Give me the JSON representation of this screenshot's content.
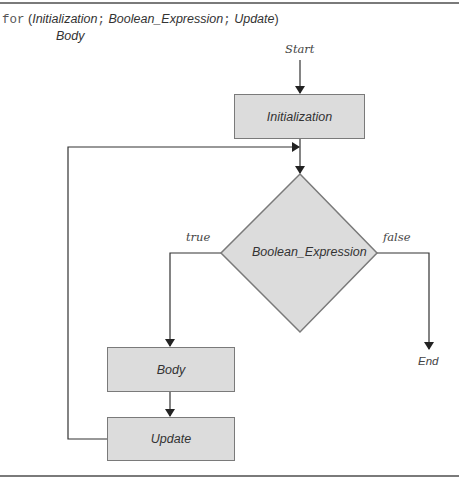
{
  "header": {
    "keyword": "for",
    "open_paren": "(",
    "initialization": "Initialization",
    "sep1": ";",
    "boolean_expression": "Boolean_Expression",
    "sep2": ";",
    "update": "Update",
    "close_paren": ")",
    "body": "Body"
  },
  "flowchart": {
    "start": "Start",
    "end": "End",
    "nodes": {
      "initialization": "Initialization",
      "condition": "Boolean_Expression",
      "body": "Body",
      "update": "Update"
    },
    "branches": {
      "true_label": "true",
      "false_label": "false"
    }
  },
  "colors": {
    "box_fill": "#dcdcdc",
    "box_border": "#7a7a7a",
    "line": "#333333",
    "rule": "#7a7a7a"
  }
}
